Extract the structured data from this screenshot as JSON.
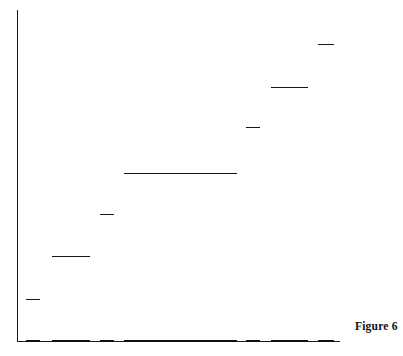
{
  "figure": {
    "caption": "Figure 6",
    "caption_x": 355,
    "caption_y": 320
  },
  "chart_data": {
    "type": "bar",
    "title": "",
    "subtitle": "",
    "xlabel": "",
    "ylabel": "",
    "grid": false,
    "legend": null,
    "axis_color": "#1b1b1b",
    "bar_color": "#151515",
    "axes": {
      "x_axis_start_px": 17,
      "x_axis_end_px": 340,
      "y_axis_top_px": 10,
      "baseline_px": 341,
      "xlim": [
        0,
        323
      ],
      "ylim": [
        0,
        331
      ],
      "x_ticks": [],
      "y_ticks": [],
      "x_tick_labels": [],
      "y_tick_labels": []
    },
    "categories": [
      "1",
      "2",
      "3",
      "4",
      "5",
      "6",
      "7"
    ],
    "values": [
      42,
      85,
      127,
      168,
      214,
      254,
      297
    ],
    "bars": [
      {
        "index": 1,
        "x_start": 26,
        "x_end": 40,
        "top_y": 299,
        "width": 14,
        "height": 42
      },
      {
        "index": 2,
        "x_start": 52,
        "x_end": 90,
        "top_y": 256,
        "width": 38,
        "height": 85
      },
      {
        "index": 3,
        "x_start": 100,
        "x_end": 114,
        "top_y": 214,
        "width": 14,
        "height": 127
      },
      {
        "index": 4,
        "x_start": 124,
        "x_end": 237,
        "top_y": 173,
        "width": 113,
        "height": 168
      },
      {
        "index": 5,
        "x_start": 246,
        "x_end": 260,
        "top_y": 127,
        "width": 14,
        "height": 214
      },
      {
        "index": 6,
        "x_start": 271,
        "x_end": 308,
        "top_y": 87,
        "width": 37,
        "height": 254
      },
      {
        "index": 7,
        "x_start": 318,
        "x_end": 334,
        "top_y": 44,
        "width": 16,
        "height": 297
      }
    ]
  }
}
